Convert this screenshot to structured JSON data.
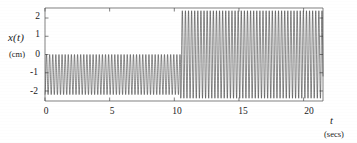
{
  "figure": {
    "title": "",
    "y_axis": {
      "label": "x(t)",
      "unit": "(cm)",
      "ticks": [
        "2",
        "1",
        "0",
        "-1",
        "-2"
      ]
    },
    "x_axis": {
      "label": "t",
      "unit": "(secs)",
      "ticks": [
        "0",
        "5",
        "10",
        "15",
        "20"
      ]
    }
  },
  "chart_data": {
    "type": "line",
    "title": "",
    "xlabel": "t",
    "xunit": "secs",
    "ylabel": "x(t)",
    "yunit": "cm",
    "xlim": [
      0,
      21.5
    ],
    "ylim": [
      -2.55,
      2.55
    ],
    "xticks": [
      0,
      5,
      10,
      15,
      20
    ],
    "yticks": [
      -2,
      -1,
      0,
      1,
      2
    ],
    "grid": false,
    "legend": null,
    "line_color": "#2b2b2b",
    "line_width": 0.5,
    "segments": [
      {
        "name": "before-transition",
        "x_start": 0,
        "x_end": 10.5,
        "y_min": -2.2,
        "y_max": 0.0,
        "center": -1.1,
        "amplitude": 1.1,
        "period": 0.24,
        "cycles": 44
      },
      {
        "name": "after-transition",
        "x_start": 10.5,
        "x_end": 21.5,
        "y_min": -2.4,
        "y_max": 2.4,
        "center": 0.0,
        "amplitude": 2.4,
        "period": 0.24,
        "cycles": 46
      }
    ],
    "transition_x": 10.5
  }
}
